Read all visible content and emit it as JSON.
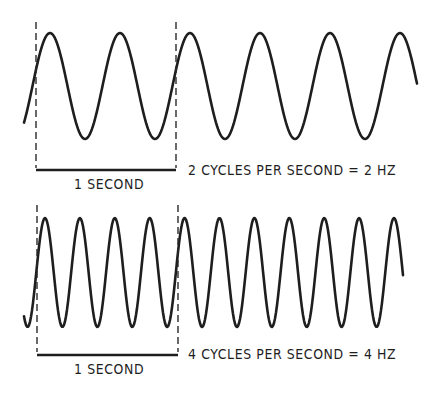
{
  "panels": [
    {
      "id": "top",
      "frequency_hz": 2,
      "interval_label": "1 SECOND",
      "description": "2 CYCLES PER SECOND = 2 HZ",
      "wave": {
        "x_start": 24,
        "x_end": 417,
        "y_peak": 33,
        "y_trough": 139,
        "period_px": 70,
        "first_peak_x": 50
      },
      "interval": {
        "x_left": 36,
        "x_right": 176,
        "y_top": 22,
        "y_bar": 170
      }
    },
    {
      "id": "bottom",
      "frequency_hz": 4,
      "interval_label": "1 SECOND",
      "description": "4 CYCLES PER SECOND = 4 HZ",
      "wave": {
        "x_start": 24,
        "x_end": 403,
        "y_peak": 218,
        "y_trough": 327,
        "period_px": 34.9,
        "first_peak_x": 45
      },
      "interval": {
        "x_left": 37,
        "x_right": 178,
        "y_top": 205,
        "y_bar": 355
      }
    }
  ],
  "colors": {
    "ink": "#1e1e1e",
    "background": "#ffffff"
  }
}
